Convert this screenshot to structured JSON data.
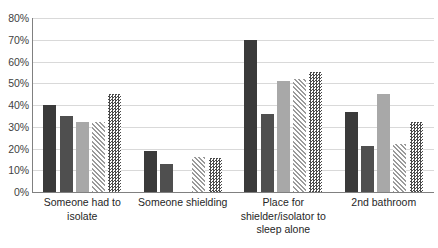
{
  "chart_data": {
    "type": "bar",
    "title": "",
    "subtitle": "",
    "xlabel": "",
    "ylabel": "",
    "ylim": [
      0,
      80
    ],
    "ytick_labels": [
      "80%",
      "70%",
      "60%",
      "50%",
      "40%",
      "30%",
      "20%",
      "10%",
      "0%"
    ],
    "ytick_values": [
      80,
      70,
      60,
      50,
      40,
      30,
      20,
      10,
      0
    ],
    "grid": true,
    "legend_position": "none",
    "value_suffix": "%",
    "categories": [
      "Someone had to isolate",
      "Someone shielding",
      "Place for shielder/isolator to sleep alone",
      "2nd bathroom"
    ],
    "category_lines": [
      [
        "Someone had to",
        "isolate"
      ],
      [
        "Someone shielding"
      ],
      [
        "Place for",
        "shielder/isolator to",
        "sleep alone"
      ],
      [
        "2nd bathroom"
      ]
    ],
    "series": [
      {
        "name": "Series 1",
        "pattern": "solid-dark",
        "color": "#3a3a3a",
        "values": [
          40,
          19,
          70,
          37
        ]
      },
      {
        "name": "Series 2",
        "pattern": "solid-mid",
        "color": "#4f4f4f",
        "values": [
          35,
          13,
          36,
          21
        ]
      },
      {
        "name": "Series 3",
        "pattern": "solid-light",
        "color": "#a8a8a8",
        "values": [
          32,
          0,
          51,
          45
        ]
      },
      {
        "name": "Series 4",
        "pattern": "diagonal-hatch",
        "color": "#9a9a9a",
        "values": [
          32,
          16,
          52,
          22
        ]
      },
      {
        "name": "Series 5",
        "pattern": "checkerboard",
        "color": "#4a4a4a",
        "values": [
          45,
          15.5,
          55,
          32
        ]
      }
    ]
  },
  "colors": {
    "gridline": "#d9d9d9",
    "axis": "#808080",
    "text": "#262626",
    "background": "#ffffff"
  }
}
